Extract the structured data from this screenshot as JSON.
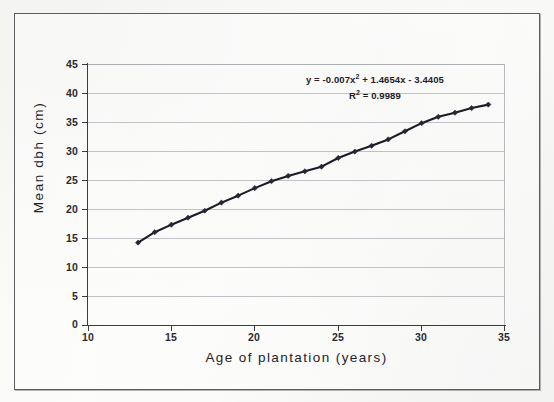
{
  "figure": {
    "caption_present": false
  },
  "chart_data": {
    "type": "scatter",
    "title": "",
    "xlabel": "Age of plantation (years)",
    "ylabel": "Mean dbh (cm)",
    "xlim": [
      10,
      35
    ],
    "ylim": [
      0,
      45
    ],
    "xticks": [
      10,
      15,
      20,
      25,
      30,
      35
    ],
    "yticks": [
      0,
      5,
      10,
      15,
      20,
      25,
      30,
      35,
      40,
      45
    ],
    "grid": "horizontal",
    "legend": "none",
    "marker": "diamond",
    "marker_color": "#262633",
    "line_color": "#1b1b28",
    "annotations": {
      "equation": "y = -0.007x² + 1.4654x - 3.4405",
      "equation_base": "y = -0.007x",
      "equation_exp": "2",
      "equation_tail": " + 1.4654x - 3.4405",
      "r_squared": "R² = 0.9989",
      "r_squared_base": "R",
      "r_squared_exp": "2",
      "r_squared_tail": " = 0.9989"
    },
    "trendline": {
      "kind": "polynomial",
      "degree": 2,
      "a": -0.007,
      "b": 1.4654,
      "c": -3.4405,
      "r2": 0.9989
    },
    "x": [
      13,
      14,
      15,
      16,
      17,
      18,
      19,
      20,
      21,
      22,
      23,
      24,
      25,
      26,
      27,
      28,
      29,
      30,
      31,
      32,
      33,
      34
    ],
    "y": [
      14.2,
      16.0,
      17.3,
      18.5,
      19.7,
      21.1,
      22.3,
      23.6,
      24.8,
      25.7,
      26.5,
      27.3,
      28.8,
      29.9,
      30.9,
      32.0,
      33.4,
      34.8,
      35.9,
      36.6,
      37.4,
      38.0
    ]
  },
  "ticks": {
    "y_labels": [
      "45",
      "40",
      "35",
      "30",
      "25",
      "20",
      "15",
      "10",
      "5",
      "0"
    ],
    "x_labels": [
      "10",
      "15",
      "20",
      "25",
      "30",
      "35"
    ]
  },
  "colors": {
    "grid": "#a9a9b2",
    "axis": "#3b3b42",
    "series": "#1b1b28",
    "frame": "#5c5c63",
    "page": "#fdfdfb"
  }
}
